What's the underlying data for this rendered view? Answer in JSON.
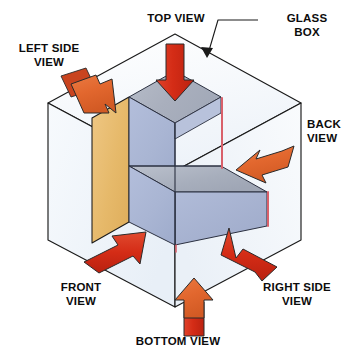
{
  "diagram": {
    "labels": {
      "top_view": "TOP VIEW",
      "glass_box": "GLASS\nBOX",
      "left_side_view": "LEFT SIDE\nVIEW",
      "back_view": "BACK\nVIEW",
      "front_view": "FRONT\nVIEW",
      "right_side_view": "RIGHT SIDE\nVIEW",
      "bottom_view": "BOTTOM VIEW"
    },
    "colors": {
      "background": "#ffffff",
      "line": "#1a1a1a",
      "glass_pane_fill": "#f4f7fb",
      "glass_pane_fill_alt": "#eef3f9",
      "object_top_face": "#a8aebc",
      "object_top_face_light": "#b4bac6",
      "object_front_face": "#aab6d4",
      "object_front_face_dark": "#9aa7c8",
      "object_left_face": "#e8b96a",
      "object_edge_highlight": "#d9606a",
      "arrow_red": "#d9301a",
      "arrow_red_dark": "#c02512",
      "arrow_orange": "#e2672e",
      "arrow_outline": "#2a2a2a",
      "label_text": "#0c0c0c"
    },
    "arrows": [
      {
        "name": "top-view-arrow",
        "view": "TOP VIEW",
        "direction": "down",
        "color": "#d9301a"
      },
      {
        "name": "left-side-view-arrow",
        "view": "LEFT SIDE VIEW",
        "direction": "down-right",
        "color": "#e2672e"
      },
      {
        "name": "back-view-arrow",
        "view": "BACK VIEW",
        "direction": "down-left",
        "color": "#e2672e"
      },
      {
        "name": "front-view-arrow",
        "view": "FRONT VIEW",
        "direction": "up-right",
        "color": "#d9301a"
      },
      {
        "name": "right-side-view-arrow",
        "view": "RIGHT SIDE VIEW",
        "direction": "up-left",
        "color": "#d9301a"
      },
      {
        "name": "bottom-view-arrow",
        "view": "BOTTOM VIEW",
        "direction": "up",
        "color": "#e2672e"
      }
    ],
    "object": {
      "name": "L-shaped block",
      "faces": [
        "top",
        "front",
        "left side",
        "right side step"
      ]
    }
  }
}
